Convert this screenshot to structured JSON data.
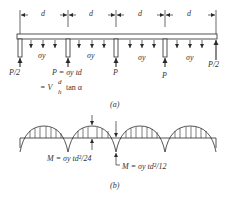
{
  "figure_a": {
    "caption": "(a)",
    "span_label": "d",
    "span_count": 4,
    "stress_label": "σy",
    "reaction_end": "P/2",
    "reaction_mid": "P",
    "formula_line1": "P = σy td",
    "formula_line2_prefix": "= V",
    "formula_frac_num": "d",
    "formula_frac_den": "h",
    "formula_line2_suffix": "tan α"
  },
  "figure_b": {
    "caption": "(b)",
    "moment_midspan": "M = σy td²/24",
    "moment_support": "M = σy td²/12"
  },
  "colors": {
    "line": "#2a2a2a",
    "text": "#333333",
    "background": "#ffffff"
  }
}
